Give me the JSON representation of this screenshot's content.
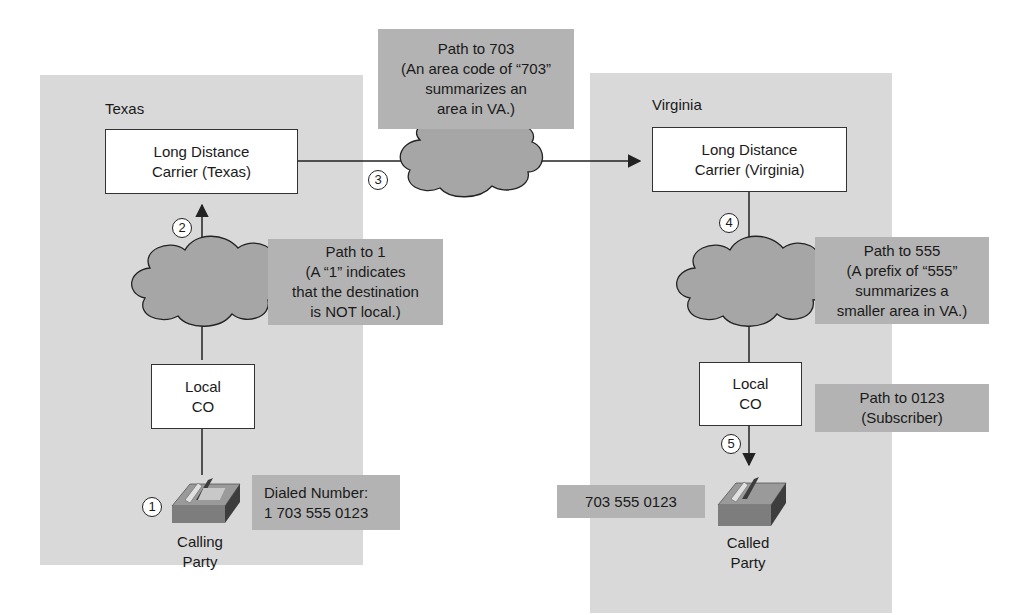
{
  "regions": {
    "texas": {
      "label": "Texas"
    },
    "virginia": {
      "label": "Virginia"
    }
  },
  "nodes": {
    "ld_texas": {
      "line1": "Long Distance",
      "line2": "Carrier (Texas)"
    },
    "ld_virginia": {
      "line1": "Long Distance",
      "line2": "Carrier (Virginia)"
    },
    "co_texas": {
      "line1": "Local",
      "line2": "CO"
    },
    "co_virginia": {
      "line1": "Local",
      "line2": "CO"
    },
    "calling_party": {
      "line1": "Calling",
      "line2": "Party"
    },
    "called_party": {
      "line1": "Called",
      "line2": "Party"
    }
  },
  "notes": {
    "path_703": {
      "lines": [
        "Path to 703",
        "(An area code of “703”",
        "summarizes an",
        "area in VA.)"
      ]
    },
    "path_1": {
      "lines": [
        "Path to 1",
        "(A “1” indicates",
        "that the destination",
        "is NOT local.)"
      ]
    },
    "path_555": {
      "lines": [
        "Path to 555",
        "(A prefix of “555”",
        "summarizes a",
        "smaller area in VA.)"
      ]
    },
    "path_0123": {
      "lines": [
        "Path to 0123",
        "(Subscriber)"
      ]
    },
    "dialed_number": {
      "lines": [
        "Dialed Number:",
        "1 703 555 0123"
      ]
    },
    "received_number": {
      "lines": [
        "703 555 0123"
      ]
    }
  },
  "steps": [
    "1",
    "2",
    "3",
    "4",
    "5"
  ],
  "colors": {
    "region_bg": "#d9d9d9",
    "note_bg": "#b3b3b3",
    "cloud_fill": "#a6a6a6",
    "line": "#222222"
  }
}
